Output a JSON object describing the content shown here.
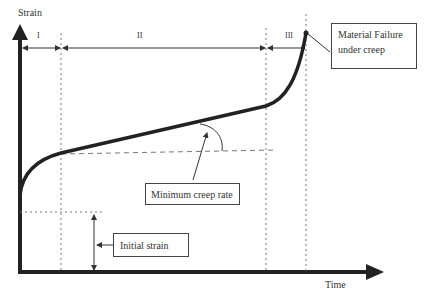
{
  "diagram": {
    "axes": {
      "y_label": "Strain",
      "x_label": "Time"
    },
    "stages": [
      {
        "label": "I"
      },
      {
        "label": "II"
      },
      {
        "label": "III"
      }
    ],
    "annotations": {
      "failure": {
        "line1": "Material Failure",
        "line2": "under creep"
      },
      "min_creep_rate": "Minimum creep rate",
      "initial_strain": "Initial strain"
    },
    "colors": {
      "curve": "#222222",
      "axis": "#222222",
      "guides": "#777777"
    }
  }
}
